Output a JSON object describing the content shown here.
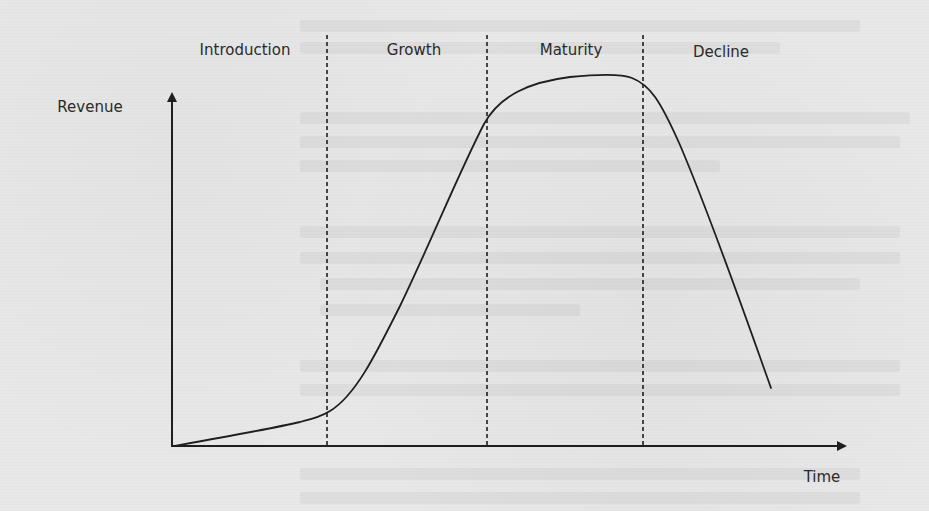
{
  "diagram": {
    "y_axis_label": "Revenue",
    "x_axis_label": "Time",
    "stages": [
      {
        "label": "Introduction"
      },
      {
        "label": "Growth"
      },
      {
        "label": "Maturity"
      },
      {
        "label": "Decline"
      }
    ],
    "curve_description": "Revenue rises slowly in Introduction, steeply in Growth, plateaus in Maturity, and falls sharply in Decline",
    "colors": {
      "ink": "#1f1f1f",
      "background": "#e8e8e8"
    }
  }
}
